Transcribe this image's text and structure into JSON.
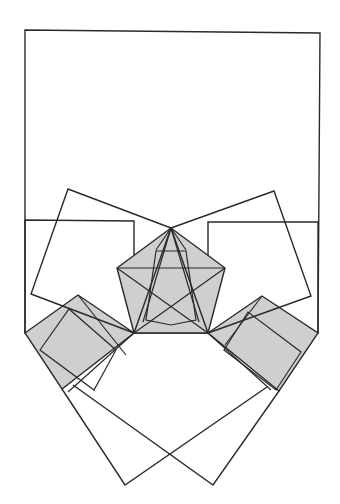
{
  "figure": {
    "colors": {
      "stroke": "#2a2a2a",
      "shade": "#cfcfcf",
      "background": "#ffffff"
    },
    "labels": []
  }
}
